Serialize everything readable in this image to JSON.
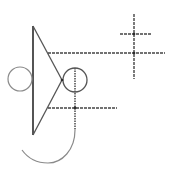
{
  "diagram": {
    "stroke_colors": {
      "dark": "#2a2a2a",
      "mid": "#555555",
      "light": "#8a8a8a"
    },
    "background": "#ffffff",
    "elements": [
      {
        "type": "line",
        "name": "triangle-base",
        "x1": 33,
        "y1": 26,
        "x2": 33,
        "y2": 135
      },
      {
        "type": "line",
        "name": "triangle-upper-edge",
        "x1": 33,
        "y1": 26,
        "x2": 62,
        "y2": 80
      },
      {
        "type": "line",
        "name": "triangle-lower-edge",
        "x1": 62,
        "y1": 80,
        "x2": 33,
        "y2": 135
      },
      {
        "type": "circle",
        "name": "left-circle",
        "cx": 20,
        "cy": 79,
        "r": 12
      },
      {
        "type": "circle",
        "name": "right-circle",
        "cx": 75,
        "cy": 80,
        "r": 12
      },
      {
        "type": "line",
        "name": "upper-horizontal",
        "x1": 48,
        "y1": 53,
        "x2": 165,
        "y2": 53
      },
      {
        "type": "line",
        "name": "lower-horizontal",
        "x1": 48,
        "y1": 108,
        "x2": 117,
        "y2": 108
      },
      {
        "type": "line",
        "name": "center-vertical",
        "x1": 75,
        "y1": 68,
        "x2": 75,
        "y2": 130
      },
      {
        "type": "line",
        "name": "cross-vertical",
        "x1": 134,
        "y1": 14,
        "x2": 134,
        "y2": 79
      },
      {
        "type": "line",
        "name": "cross-short-horizontal",
        "x1": 120,
        "y1": 34,
        "x2": 151,
        "y2": 34
      },
      {
        "type": "arc",
        "name": "bottom-hook",
        "path": "M75 130 C75 150 62 163 48 163 C36 163 27 157 22 150"
      }
    ]
  }
}
